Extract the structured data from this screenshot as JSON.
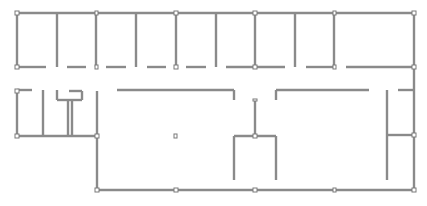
{
  "diagram": {
    "type": "floor-plan",
    "colors": {
      "wall": "#8a8a8a",
      "background": "#ffffff",
      "node": "#ffffff"
    },
    "room_labels": [
      {
        "id": "room-label-1",
        "text": "",
        "x": 118,
        "y": 53
      },
      {
        "id": "room-label-2",
        "text": "",
        "x": 300,
        "y": 52
      }
    ]
  }
}
